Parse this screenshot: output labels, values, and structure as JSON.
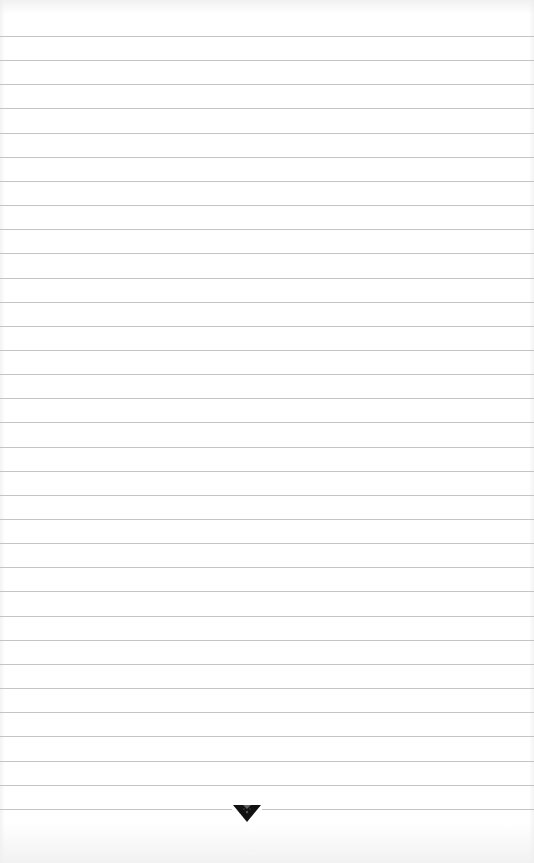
{
  "page": {
    "type": "lined-paper",
    "background_color": "#ffffff",
    "line_color": "#c4c4c4",
    "line_count": 33,
    "first_line_y": 36,
    "line_spacing": 24.15
  },
  "ornament": {
    "icon": "down-triangle-ornament-icon",
    "color": "#111111",
    "center_x": 247,
    "center_y": 812
  }
}
